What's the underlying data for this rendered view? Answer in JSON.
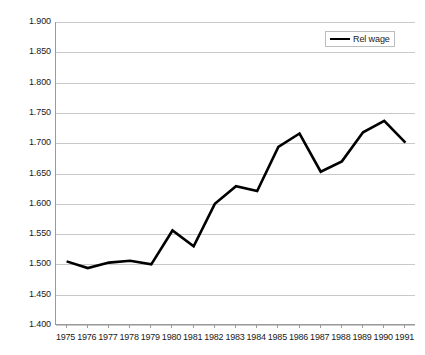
{
  "chart_data": {
    "type": "line",
    "title": "",
    "xlabel": "",
    "ylabel": "",
    "grid": true,
    "legend_position": "top-right",
    "ylim": [
      1.4,
      1.9
    ],
    "ytick_step": 0.05,
    "ytick_labels": [
      "1.900",
      "1.850",
      "1.800",
      "1.750",
      "1.700",
      "1.650",
      "1.600",
      "1.550",
      "1.500",
      "1.450",
      "1.400"
    ],
    "ytick_values": [
      1.9,
      1.85,
      1.8,
      1.75,
      1.7,
      1.65,
      1.6,
      1.55,
      1.5,
      1.45,
      1.4
    ],
    "categories": [
      "1975",
      "1976",
      "1977",
      "1978",
      "1979",
      "1980",
      "1981",
      "1982",
      "1983",
      "1984",
      "1985",
      "1986",
      "1987",
      "1988",
      "1989",
      "1990",
      "1991"
    ],
    "series": [
      {
        "name": "Rel wage",
        "color": "#000000",
        "values": [
          1.505,
          1.494,
          1.503,
          1.506,
          1.5,
          1.556,
          1.53,
          1.6,
          1.629,
          1.621,
          1.694,
          1.716,
          1.653,
          1.67,
          1.718,
          1.737,
          1.701
        ]
      }
    ]
  },
  "legend": {
    "entries": [
      {
        "label": "Rel wage",
        "color": "#000000"
      }
    ]
  }
}
